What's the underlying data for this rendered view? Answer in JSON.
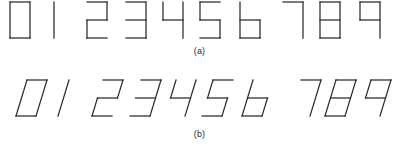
{
  "figure": {
    "title": "",
    "background_color": "#ffffff",
    "stroke_color": "#2a2a2a",
    "rows": [
      {
        "id": "row-a",
        "caption": "(a)",
        "style": "upright",
        "slant_degrees": 0,
        "digits": [
          "0",
          "1",
          "2",
          "3",
          "4",
          "5",
          "6",
          "7",
          "8",
          "9"
        ]
      },
      {
        "id": "row-b",
        "caption": "(b)",
        "style": "slanted",
        "slant_degrees": 17,
        "digits": [
          "0",
          "1",
          "2",
          "3",
          "4",
          "5",
          "6",
          "7",
          "8",
          "9"
        ]
      }
    ]
  },
  "captions": {
    "a": "(a)",
    "b": "(b)"
  },
  "glyph_strokes": {
    "0": [
      [
        [
          2,
          2
        ],
        [
          22,
          2
        ]
      ],
      [
        [
          22,
          2
        ],
        [
          22,
          38
        ]
      ],
      [
        [
          22,
          38
        ],
        [
          2,
          38
        ]
      ],
      [
        [
          2,
          38
        ],
        [
          2,
          2
        ]
      ]
    ],
    "1": [
      [
        [
          12,
          2
        ],
        [
          12,
          38
        ]
      ]
    ],
    "2": [
      [
        [
          2,
          2
        ],
        [
          22,
          2
        ]
      ],
      [
        [
          22,
          2
        ],
        [
          22,
          20
        ]
      ],
      [
        [
          22,
          20
        ],
        [
          2,
          20
        ]
      ],
      [
        [
          2,
          20
        ],
        [
          2,
          38
        ]
      ],
      [
        [
          2,
          38
        ],
        [
          22,
          38
        ]
      ]
    ],
    "3": [
      [
        [
          2,
          2
        ],
        [
          22,
          2
        ]
      ],
      [
        [
          22,
          2
        ],
        [
          22,
          38
        ]
      ],
      [
        [
          2,
          20
        ],
        [
          22,
          20
        ]
      ],
      [
        [
          2,
          38
        ],
        [
          22,
          38
        ]
      ]
    ],
    "4": [
      [
        [
          2,
          2
        ],
        [
          2,
          20
        ]
      ],
      [
        [
          2,
          20
        ],
        [
          22,
          20
        ]
      ],
      [
        [
          22,
          2
        ],
        [
          22,
          38
        ]
      ]
    ],
    "5": [
      [
        [
          22,
          2
        ],
        [
          2,
          2
        ]
      ],
      [
        [
          2,
          2
        ],
        [
          2,
          20
        ]
      ],
      [
        [
          2,
          20
        ],
        [
          22,
          20
        ]
      ],
      [
        [
          22,
          20
        ],
        [
          22,
          38
        ]
      ],
      [
        [
          22,
          38
        ],
        [
          2,
          38
        ]
      ]
    ],
    "6": [
      [
        [
          2,
          2
        ],
        [
          2,
          38
        ]
      ],
      [
        [
          2,
          20
        ],
        [
          22,
          20
        ]
      ],
      [
        [
          22,
          20
        ],
        [
          22,
          38
        ]
      ],
      [
        [
          22,
          38
        ],
        [
          2,
          38
        ]
      ]
    ],
    "7": [
      [
        [
          2,
          2
        ],
        [
          22,
          2
        ]
      ],
      [
        [
          22,
          2
        ],
        [
          22,
          38
        ]
      ]
    ],
    "8": [
      [
        [
          2,
          2
        ],
        [
          22,
          2
        ]
      ],
      [
        [
          22,
          2
        ],
        [
          22,
          38
        ]
      ],
      [
        [
          22,
          38
        ],
        [
          2,
          38
        ]
      ],
      [
        [
          2,
          38
        ],
        [
          2,
          2
        ]
      ],
      [
        [
          2,
          20
        ],
        [
          22,
          20
        ]
      ]
    ],
    "9": [
      [
        [
          2,
          2
        ],
        [
          22,
          2
        ]
      ],
      [
        [
          22,
          2
        ],
        [
          22,
          38
        ]
      ],
      [
        [
          2,
          2
        ],
        [
          2,
          20
        ]
      ],
      [
        [
          2,
          20
        ],
        [
          22,
          20
        ]
      ]
    ]
  },
  "layout": {
    "glyph_box": {
      "width": 24,
      "height": 40
    },
    "row_a_positions": [
      8,
      42,
      85,
      124,
      161,
      198,
      238,
      281,
      318,
      358
    ],
    "row_b_positions": [
      14,
      46,
      90,
      128,
      163,
      200,
      240,
      288,
      323,
      358
    ],
    "row_a_top": 2,
    "row_b_top": 2
  }
}
